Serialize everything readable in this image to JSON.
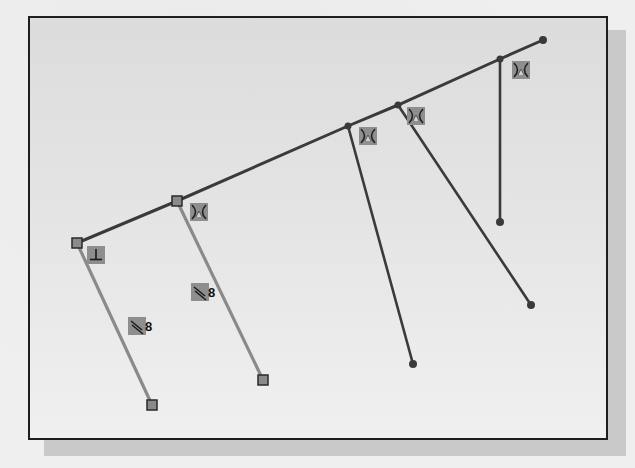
{
  "figure": {
    "type": "cad-sketch",
    "colors": {
      "frame_border": "#1e1e1e",
      "shadow": "#c9c9c9",
      "line_dark": "#3a3a3a",
      "line_light": "#8a8a8a",
      "constraint_bg": "#8e8e8e"
    },
    "main_line": {
      "points": [
        [
          77,
          243
        ],
        [
          177,
          201
        ],
        [
          348,
          126
        ],
        [
          398,
          105
        ],
        [
          500,
          59
        ],
        [
          543,
          40
        ]
      ]
    },
    "branches": [
      {
        "from": [
          77,
          243
        ],
        "to": [
          152,
          405
        ],
        "style": "light",
        "end": "square"
      },
      {
        "from": [
          177,
          201
        ],
        "to": [
          263,
          380
        ],
        "style": "light",
        "end": "square"
      },
      {
        "from": [
          348,
          126
        ],
        "to": [
          413,
          364
        ],
        "style": "dark",
        "end": "dot"
      },
      {
        "from": [
          398,
          105
        ],
        "to": [
          531,
          305
        ],
        "style": "dark",
        "end": "dot"
      },
      {
        "from": [
          500,
          59
        ],
        "to": [
          500,
          222
        ],
        "style": "dark",
        "end": "dot"
      }
    ],
    "constraints": [
      {
        "icon": "perpendicular-icon",
        "x": 87,
        "y": 246,
        "label": ""
      },
      {
        "icon": "parallel-icon",
        "x": 128,
        "y": 317,
        "label": "8"
      },
      {
        "icon": "parallel-icon",
        "x": 191,
        "y": 283,
        "label": "8"
      },
      {
        "icon": "tangent-icon",
        "x": 190,
        "y": 203,
        "label": ""
      },
      {
        "icon": "tangent-icon",
        "x": 359,
        "y": 127,
        "label": ""
      },
      {
        "icon": "tangent-icon",
        "x": 407,
        "y": 107,
        "label": ""
      },
      {
        "icon": "tangent-icon",
        "x": 512,
        "y": 61,
        "label": ""
      }
    ]
  },
  "constraint_labels": {
    "parallel_a": "8",
    "parallel_b": "8"
  },
  "background_bleed_text": [
    "Place the dimension above the",
    "line as shown.",
    "20. Click OK in the Modify dialog"
  ]
}
